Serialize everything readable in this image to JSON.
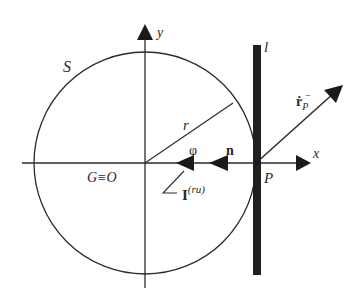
{
  "diagram": {
    "type": "geometry-figure",
    "colors": {
      "stroke": "#2b2b2b",
      "background": "#ffffff"
    },
    "labels": {
      "circle": "S",
      "y_axis": "y",
      "x_axis": "x",
      "line": "l",
      "radius": "r",
      "origin": "G≡O",
      "point": "P",
      "normal_vector": "n",
      "angle_phi": "φ",
      "impulse_base": "I",
      "impulse_sup": "(ru)",
      "velocity_base": "ṙ",
      "velocity_sub": "P",
      "velocity_sup": "−"
    },
    "elements": [
      {
        "name": "circle-S",
        "shape": "circle",
        "center": [
          145,
          163
        ],
        "radius": 111
      },
      {
        "name": "x-axis",
        "shape": "arrow",
        "from": [
          22,
          163
        ],
        "to": [
          310,
          163
        ]
      },
      {
        "name": "y-axis",
        "shape": "arrow",
        "from": [
          145,
          288
        ],
        "to": [
          145,
          25
        ]
      },
      {
        "name": "line-l",
        "shape": "thick-line",
        "from": [
          257,
          45
        ],
        "to": [
          257,
          275
        ]
      },
      {
        "name": "radius-r",
        "shape": "line",
        "from": [
          145,
          163
        ],
        "to": [
          233,
          103
        ]
      },
      {
        "name": "velocity-arrow",
        "shape": "arrow",
        "from": [
          256,
          163
        ],
        "to": [
          343,
          85
        ]
      },
      {
        "name": "normal-arrow-n",
        "shape": "arrowhead",
        "tip": [
          209,
          163
        ]
      },
      {
        "name": "impulse-arrow-I",
        "shape": "arrowhead",
        "tip": [
          176,
          163
        ]
      }
    ]
  }
}
